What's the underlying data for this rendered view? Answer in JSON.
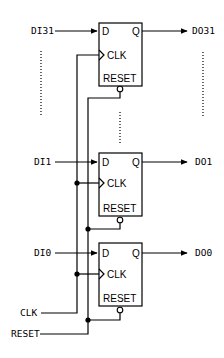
{
  "diagram": {
    "type": "register-bank-schematic",
    "flipflops": [
      {
        "id": "ff31",
        "input_label": "DI31",
        "output_label": "DO31",
        "pin_d": "D",
        "pin_q": "Q",
        "pin_clk": "CLK",
        "pin_reset": "RESET"
      },
      {
        "id": "ff1",
        "input_label": "DI1",
        "output_label": "DO1",
        "pin_d": "D",
        "pin_q": "Q",
        "pin_clk": "CLK",
        "pin_reset": "RESET"
      },
      {
        "id": "ff0",
        "input_label": "DI0",
        "output_label": "DO0",
        "pin_d": "D",
        "pin_q": "Q",
        "pin_clk": "CLK",
        "pin_reset": "RESET"
      }
    ],
    "global_inputs": {
      "clk_label": "CLK",
      "reset_label": "RESET"
    },
    "colors": {
      "line": "#000000",
      "background": "#ffffff"
    }
  }
}
